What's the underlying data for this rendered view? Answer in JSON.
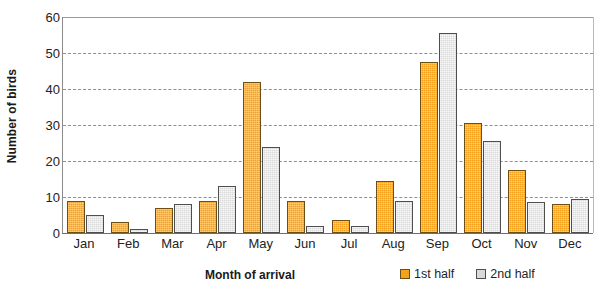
{
  "chart_data": {
    "type": "bar",
    "title": "",
    "xlabel": "Month of arrival",
    "ylabel": "Number of birds",
    "categories": [
      "Jan",
      "Feb",
      "Mar",
      "Apr",
      "May",
      "Jun",
      "Jul",
      "Aug",
      "Sep",
      "Oct",
      "Nov",
      "Dec"
    ],
    "series": [
      {
        "name": "1st half",
        "color": "#f4a11d",
        "values": [
          9,
          3,
          7,
          9,
          42,
          9,
          3.5,
          14.5,
          47.5,
          30.5,
          17.5,
          8
        ]
      },
      {
        "name": "2nd half",
        "color": "#d9d9d9",
        "values": [
          5,
          1,
          8,
          13,
          24,
          2,
          2,
          9,
          55.5,
          25.5,
          8.5,
          9.5
        ]
      }
    ],
    "ylim": [
      0,
      60
    ],
    "yticks": [
      0,
      10,
      20,
      30,
      40,
      50,
      60
    ],
    "ytick_labels": [
      "0",
      "10",
      "20",
      "30",
      "40",
      "50",
      "60"
    ],
    "grid": true,
    "legend_position": "bottom-right"
  },
  "legend": {
    "entries": [
      {
        "label": "1st half"
      },
      {
        "label": "2nd half"
      }
    ]
  }
}
